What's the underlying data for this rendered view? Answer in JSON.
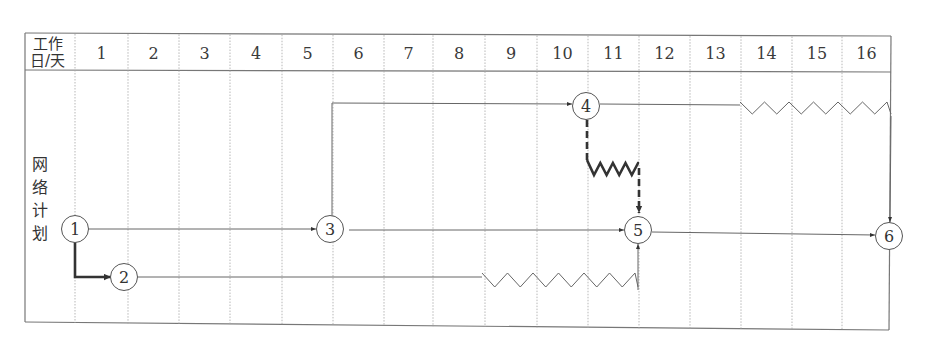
{
  "header": {
    "corner_top": "工作",
    "corner_bottom": "日/天",
    "days": [
      "1",
      "2",
      "3",
      "4",
      "5",
      "6",
      "7",
      "8",
      "9",
      "10",
      "11",
      "12",
      "13",
      "14",
      "15",
      "16"
    ]
  },
  "side_label": [
    "网",
    "络",
    "计",
    "划"
  ],
  "colors": {
    "line": "#555555",
    "bold_line": "#333333",
    "grid": "#9a9a9a",
    "border": "#666666"
  },
  "nodes": [
    {
      "id": "1",
      "label": "1",
      "day": 0
    },
    {
      "id": "2",
      "label": "2",
      "day": 1
    },
    {
      "id": "3",
      "label": "3",
      "day": 5
    },
    {
      "id": "4",
      "label": "4",
      "day": 10
    },
    {
      "id": "5",
      "label": "5",
      "day": 11
    },
    {
      "id": "6",
      "label": "6",
      "day": 16
    }
  ],
  "activities": [
    {
      "from": "1",
      "to": "2",
      "type": "critical",
      "note": "thick solid arrow, down then right"
    },
    {
      "from": "1",
      "to": "3",
      "type": "solid"
    },
    {
      "from": "2",
      "to": "5",
      "type": "solid-with-free-float",
      "work_end_day": 8,
      "float_days": 3
    },
    {
      "from": "3",
      "to": "4",
      "type": "solid"
    },
    {
      "from": "3",
      "to": "5",
      "type": "solid"
    },
    {
      "from": "4",
      "to": "5",
      "type": "dummy-with-float",
      "float_days": 1
    },
    {
      "from": "4",
      "to": "6",
      "type": "solid-with-free-float",
      "work_end_day": 13,
      "float_days": 3
    },
    {
      "from": "5",
      "to": "6",
      "type": "solid"
    }
  ]
}
